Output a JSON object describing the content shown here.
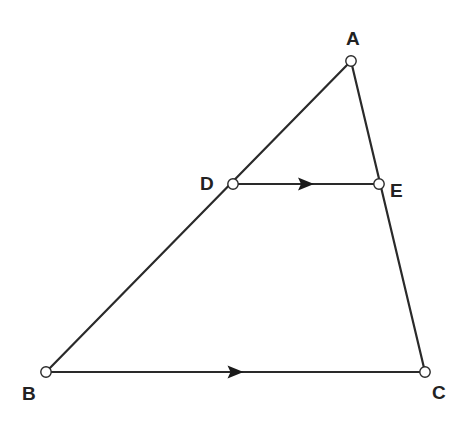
{
  "figure": {
    "colors": {
      "stroke": "#2a2a2a",
      "point_fill": "#ffffff",
      "label": "#222222",
      "background": "#ffffff"
    },
    "points": {
      "A": {
        "label": "A",
        "x": 351,
        "y": 61,
        "label_x": 346,
        "label_y": 45
      },
      "B": {
        "label": "B",
        "x": 46,
        "y": 372,
        "label_x": 22,
        "label_y": 400
      },
      "C": {
        "label": "C",
        "x": 425,
        "y": 372,
        "label_x": 432,
        "label_y": 399
      },
      "D": {
        "label": "D",
        "x": 233,
        "y": 184,
        "label_x": 200,
        "label_y": 190
      },
      "E": {
        "label": "E",
        "x": 379,
        "y": 184,
        "label_x": 390,
        "label_y": 197
      }
    },
    "segments": [
      {
        "from": "A",
        "to": "B"
      },
      {
        "from": "A",
        "to": "C"
      },
      {
        "from": "B",
        "to": "C",
        "parallel_marker": true
      },
      {
        "from": "D",
        "to": "E",
        "parallel_marker": true
      }
    ],
    "relations": [
      "DE ∥ BC"
    ]
  }
}
